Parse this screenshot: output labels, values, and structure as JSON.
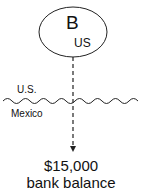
{
  "entity": {
    "letter": "B",
    "country": "US"
  },
  "border": {
    "upper_label": "U.S.",
    "lower_label": "Mexico"
  },
  "result": {
    "amount": "$15,000",
    "description": "bank balance"
  }
}
